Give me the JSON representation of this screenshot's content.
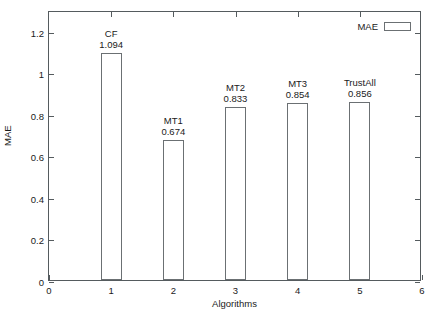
{
  "chart_data": {
    "type": "bar",
    "title": "",
    "xlabel": "Algorithms",
    "ylabel": "MAE",
    "categories": [
      "CF",
      "MT1",
      "MT2",
      "MT3",
      "TrustAll"
    ],
    "x": [
      1,
      2,
      3,
      4,
      5
    ],
    "values": [
      1.094,
      0.674,
      0.833,
      0.854,
      0.856
    ],
    "value_labels": [
      "1.094",
      "0.674",
      "0.833",
      "0.854",
      "0.856"
    ],
    "xlim": [
      0,
      6
    ],
    "ylim": [
      0,
      1.3
    ],
    "xticks": [
      "0",
      "1",
      "2",
      "3",
      "4",
      "5",
      "6"
    ],
    "xtick_values": [
      0,
      1,
      2,
      3,
      4,
      5,
      6
    ],
    "yticks": [
      "0",
      "0.2",
      "0.4",
      "0.6",
      "0.8",
      "1",
      "1.2"
    ],
    "ytick_values": [
      0,
      0.2,
      0.4,
      0.6,
      0.8,
      1.0,
      1.2
    ],
    "grid": false,
    "legend": {
      "position": "top-right",
      "entries": [
        {
          "label": "MAE",
          "swatch": "hollow-rectangle",
          "fill": "#ffffff",
          "stroke": "#6b7073"
        }
      ]
    },
    "bar_style": {
      "fill": "#ffffff",
      "stroke": "#6b7073"
    },
    "axis_color": "#555b5e",
    "background": "#ffffff"
  }
}
